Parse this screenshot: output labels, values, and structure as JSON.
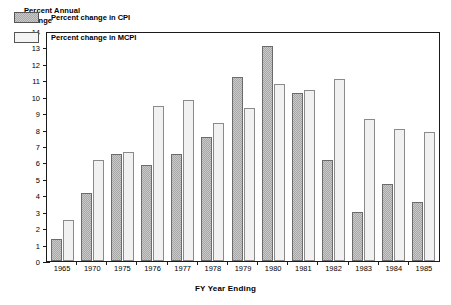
{
  "chart_data": {
    "type": "bar",
    "title": "",
    "ylabel": "Percent Annual\nChange",
    "xlabel": "FY Year Ending",
    "ylim": [
      0,
      14
    ],
    "yticks": [
      0,
      1,
      2,
      3,
      4,
      5,
      6,
      7,
      8,
      9,
      10,
      11,
      12,
      13,
      14
    ],
    "grid": false,
    "legend_position": "upper-left-inside",
    "categories": [
      "1965",
      "1970",
      "1975",
      "1976",
      "1977",
      "1978",
      "1979",
      "1980",
      "1981",
      "1982",
      "1983",
      "1984",
      "1985"
    ],
    "series": [
      {
        "name": "Percent change in CPI",
        "values": [
          1.35,
          4.2,
          6.6,
          5.9,
          6.6,
          7.6,
          11.3,
          13.2,
          10.3,
          6.2,
          3.0,
          4.7,
          3.6
        ]
      },
      {
        "name": "Percent change in MCPI",
        "values": [
          2.5,
          6.2,
          6.7,
          9.5,
          9.9,
          8.5,
          9.4,
          10.9,
          10.5,
          11.2,
          8.7,
          8.1,
          7.9
        ]
      }
    ]
  },
  "legend": {
    "items": [
      {
        "label": "Percent change in CPI",
        "swatch": "cpi-swatch"
      },
      {
        "label": "Percent change in MCPI",
        "swatch": "mcpi-swatch"
      }
    ]
  }
}
